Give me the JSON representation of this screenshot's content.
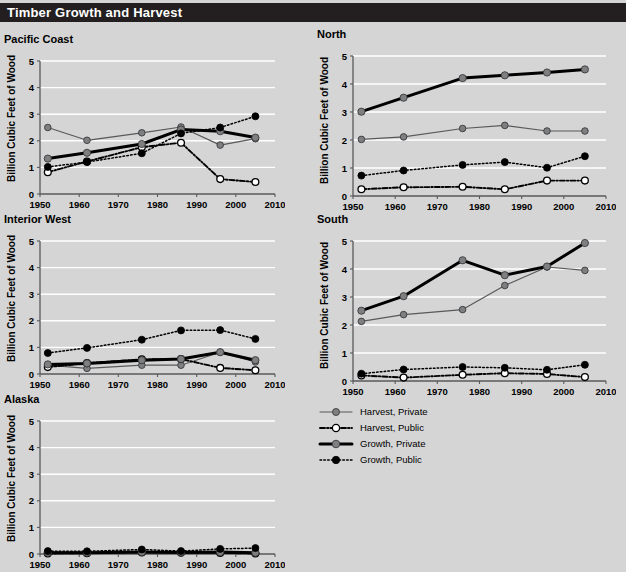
{
  "header": {
    "title": "Timber Growth and Harvest"
  },
  "colors": {
    "background": "#d5d5d5",
    "title_bar": "#231f20",
    "title_text": "#ffffff",
    "gridline": "#ffffff",
    "axis": "#58595b",
    "private_marker": "#7e7f81",
    "public_marker_fill": "#ffffff",
    "growth_public_marker": "#000000",
    "line_dark": "#000000"
  },
  "axes": {
    "ylabel": "Billion Cubic Feet of Wood",
    "yticks": [
      "0",
      "1",
      "2",
      "3",
      "4",
      "5"
    ],
    "xticks": [
      "1950",
      "1960",
      "1970",
      "1980",
      "1990",
      "2000",
      "2010"
    ],
    "xlim": [
      1950,
      2010
    ],
    "ylim": [
      0,
      5
    ]
  },
  "legend": {
    "position": "bottom-right",
    "items": [
      {
        "label": "Harvest, Private",
        "style": "solid-thin",
        "marker": "filled-gray",
        "color": "#7e7f81"
      },
      {
        "label": "Harvest, Public",
        "style": "dash-dot",
        "marker": "open-white",
        "color": "#000000"
      },
      {
        "label": "Growth, Private",
        "style": "solid-thick",
        "marker": "filled-gray",
        "color": "#7e7f81"
      },
      {
        "label": "Growth, Public",
        "style": "dotted",
        "marker": "filled-black",
        "color": "#000000"
      }
    ]
  },
  "chart_data": [
    {
      "type": "line",
      "title": "Pacific Coast",
      "xlabel": "",
      "ylabel": "Billion Cubic Feet of Wood",
      "xlim": [
        1950,
        2010
      ],
      "ylim": [
        0,
        5
      ],
      "grid": true,
      "x": [
        1952,
        1962,
        1976,
        1986,
        1996,
        2005
      ],
      "series": [
        {
          "name": "Harvest, Private",
          "values": [
            2.5,
            2.02,
            2.3,
            2.52,
            1.84,
            2.08
          ]
        },
        {
          "name": "Harvest, Public",
          "values": [
            0.82,
            1.22,
            1.76,
            1.93,
            0.56,
            0.45
          ]
        },
        {
          "name": "Growth, Private",
          "values": [
            1.33,
            1.55,
            1.88,
            2.42,
            2.36,
            2.12
          ]
        },
        {
          "name": "Growth, Public",
          "values": [
            1.02,
            1.2,
            1.53,
            2.28,
            2.5,
            2.92
          ]
        }
      ]
    },
    {
      "type": "line",
      "title": "North",
      "xlabel": "",
      "ylabel": "Billion Cubic Feet of Wood",
      "xlim": [
        1950,
        2010
      ],
      "ylim": [
        0,
        5
      ],
      "grid": true,
      "x": [
        1952,
        1962,
        1976,
        1986,
        1996,
        2005
      ],
      "series": [
        {
          "name": "Harvest, Private",
          "values": [
            2.02,
            2.11,
            2.41,
            2.52,
            2.32,
            2.32
          ]
        },
        {
          "name": "Harvest, Public",
          "values": [
            0.24,
            0.31,
            0.33,
            0.24,
            0.55,
            0.55
          ]
        },
        {
          "name": "Growth, Private",
          "values": [
            3.01,
            3.51,
            4.21,
            4.31,
            4.41,
            4.52
          ]
        },
        {
          "name": "Growth, Public",
          "values": [
            0.73,
            0.91,
            1.11,
            1.21,
            1.01,
            1.42
          ]
        }
      ]
    },
    {
      "type": "line",
      "title": "Interior West",
      "xlabel": "",
      "ylabel": "Billion Cubic Feet of Wood",
      "xlim": [
        1950,
        2010
      ],
      "ylim": [
        0,
        5
      ],
      "grid": true,
      "x": [
        1952,
        1962,
        1976,
        1986,
        1996,
        2005
      ],
      "series": [
        {
          "name": "Harvest, Private",
          "values": [
            0.33,
            0.21,
            0.33,
            0.33,
            0.82,
            0.45
          ]
        },
        {
          "name": "Harvest, Public",
          "values": [
            0.26,
            0.41,
            0.55,
            0.56,
            0.23,
            0.14
          ]
        },
        {
          "name": "Growth, Private",
          "values": [
            0.36,
            0.4,
            0.52,
            0.56,
            0.82,
            0.52
          ]
        },
        {
          "name": "Growth, Public",
          "values": [
            0.79,
            0.98,
            1.29,
            1.64,
            1.65,
            1.32
          ]
        }
      ]
    },
    {
      "type": "line",
      "title": "South",
      "xlabel": "",
      "ylabel": "Billion Cubic Feet of Wood",
      "xlim": [
        1950,
        2010
      ],
      "ylim": [
        0,
        5
      ],
      "grid": true,
      "x": [
        1952,
        1962,
        1976,
        1986,
        1996,
        2005
      ],
      "series": [
        {
          "name": "Harvest, Private",
          "values": [
            2.13,
            2.37,
            2.55,
            3.41,
            4.07,
            3.95
          ]
        },
        {
          "name": "Harvest, Public",
          "values": [
            0.2,
            0.12,
            0.22,
            0.28,
            0.25,
            0.14
          ]
        },
        {
          "name": "Growth, Private",
          "values": [
            2.51,
            3.03,
            4.31,
            3.78,
            4.09,
            4.93
          ]
        },
        {
          "name": "Growth, Public",
          "values": [
            0.26,
            0.41,
            0.5,
            0.47,
            0.4,
            0.58
          ]
        }
      ]
    },
    {
      "type": "line",
      "title": "Alaska",
      "xlabel": "",
      "ylabel": "Billion Cubic Feet of Wood",
      "xlim": [
        1950,
        2010
      ],
      "ylim": [
        0,
        5
      ],
      "grid": true,
      "x": [
        1952,
        1962,
        1976,
        1986,
        1996,
        2005
      ],
      "series": [
        {
          "name": "Harvest, Private",
          "values": [
            0.04,
            0.04,
            0.06,
            0.05,
            0.06,
            0.03
          ]
        },
        {
          "name": "Harvest, Public",
          "values": [
            0.02,
            0.03,
            0.06,
            0.05,
            0.04,
            0.02
          ]
        },
        {
          "name": "Growth, Private",
          "values": [
            0.05,
            0.05,
            0.07,
            0.06,
            0.07,
            0.05
          ]
        },
        {
          "name": "Growth, Public",
          "values": [
            0.11,
            0.1,
            0.17,
            0.11,
            0.19,
            0.22
          ]
        }
      ]
    }
  ]
}
